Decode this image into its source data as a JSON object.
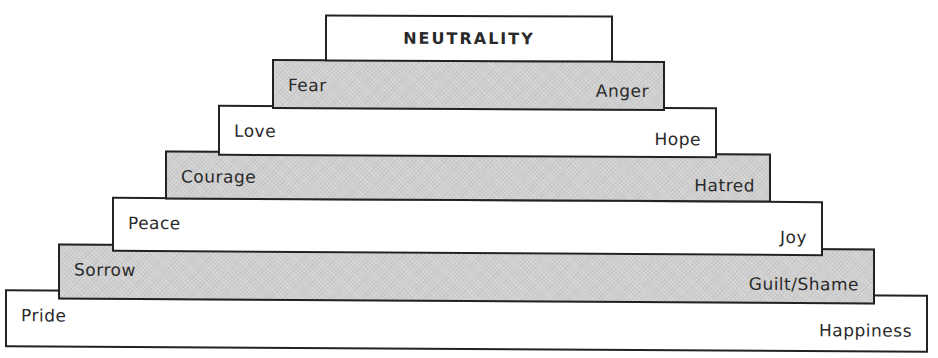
{
  "diagram": {
    "type": "stepped-pyramid",
    "apex": {
      "label": "NEUTRALITY"
    },
    "tiers": [
      {
        "left_label": "Fear",
        "right_label": "Anger",
        "fill": "gray"
      },
      {
        "left_label": "Love",
        "right_label": "Hope",
        "fill": "white"
      },
      {
        "left_label": "Courage",
        "right_label": "Hatred",
        "fill": "gray"
      },
      {
        "left_label": "Peace",
        "right_label": "Joy",
        "fill": "white"
      },
      {
        "left_label": "Sorrow",
        "right_label": "Guilt/Shame",
        "fill": "gray"
      },
      {
        "left_label": "Pride",
        "right_label": "Happiness",
        "fill": "white"
      }
    ],
    "colors": {
      "gray_fill": "#cfcfcf",
      "white_fill": "#ffffff",
      "border": "#222222",
      "text": "#2a2a2a"
    }
  }
}
